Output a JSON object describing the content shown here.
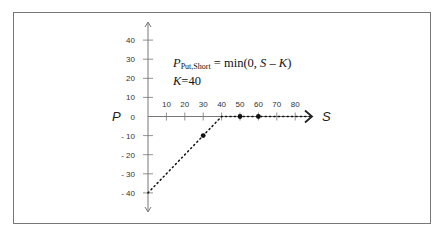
{
  "figure": {
    "formula": {
      "lhs_symbol": "P",
      "lhs_subscript": "Put,Short",
      "equals": " = ",
      "rhs_func": "min(0, ",
      "rhs_var_s": "S",
      "rhs_minus": " – ",
      "rhs_var_k": "K",
      "rhs_close": ")",
      "strike_symbol": "K",
      "strike_eq": "=40"
    },
    "x_axis_label": "S",
    "y_axis_label": "P"
  },
  "chart_data": {
    "type": "line",
    "xlabel": "S",
    "ylabel": "P",
    "x_ticks": [
      10,
      20,
      30,
      40,
      50,
      60,
      70,
      80
    ],
    "y_ticks": [
      40,
      30,
      20,
      10,
      0,
      -10,
      -20,
      -30,
      -40
    ],
    "x_tick_labels": [
      "10",
      "20",
      "30",
      "40",
      "50",
      "60",
      "70",
      "80"
    ],
    "y_tick_labels": [
      "40",
      "30",
      "20",
      "10",
      "0",
      "- 10",
      "- 20",
      "- 30",
      "- 40"
    ],
    "xlim": [
      0,
      88
    ],
    "ylim": [
      -40,
      40
    ],
    "strike": 40,
    "series": [
      {
        "name": "Short put payoff",
        "style": "dotted",
        "x": [
          0,
          40,
          88
        ],
        "y": [
          -40,
          0,
          0
        ]
      },
      {
        "name": "Marked points",
        "style": "markers",
        "x": [
          30,
          50,
          60
        ],
        "y": [
          -10,
          0,
          0
        ]
      }
    ],
    "grid": false,
    "legend": null
  }
}
